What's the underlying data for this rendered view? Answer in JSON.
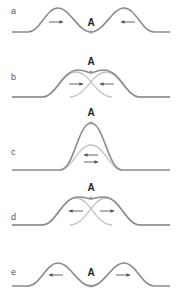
{
  "figure": {
    "colors": {
      "wave_dark": "#8c8c8c",
      "wave_light": "#c2c2c2",
      "arrow": "#555555",
      "marker": "#9a9a9a",
      "label": "#555555",
      "point_label": "#222222"
    },
    "panels": [
      {
        "id": "a",
        "label": "a",
        "point_label": "A",
        "description": "Two pulses approaching point A from opposite sides",
        "arrows": [
          "right",
          "left"
        ]
      },
      {
        "id": "b",
        "label": "b",
        "point_label": "A",
        "description": "Pulses begin to overlap at A",
        "arrows": [
          "right",
          "left"
        ]
      },
      {
        "id": "c",
        "label": "c",
        "point_label": "A",
        "description": "Pulses fully overlap; constructive interference peak at A",
        "arrows": [
          "left",
          "right"
        ]
      },
      {
        "id": "d",
        "label": "d",
        "point_label": "A",
        "description": "Pulses separating after passing through each other",
        "arrows": [
          "left",
          "right"
        ]
      },
      {
        "id": "e",
        "label": "e",
        "point_label": "A",
        "description": "Pulses moving away from point A",
        "arrows": [
          "left",
          "right"
        ]
      }
    ]
  }
}
